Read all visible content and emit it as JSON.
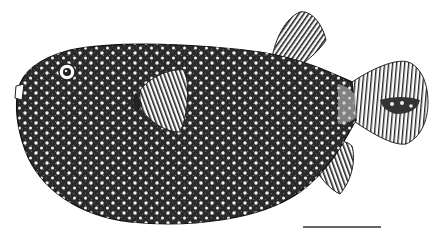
{
  "figure": {
    "style": "black and white engraving, stippled body with white spots",
    "colors": {
      "ink": "#1a1a1a",
      "paper": "#ffffff",
      "spot": "#f4f4f4"
    }
  },
  "scale_bar": {
    "x1": 303,
    "x2": 381,
    "y": 227,
    "label": ""
  }
}
